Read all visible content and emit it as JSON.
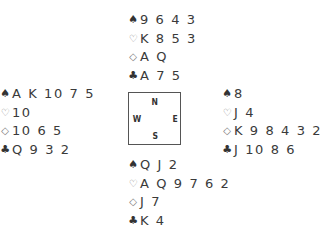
{
  "diagram": {
    "type": "bridge-deal",
    "suit_symbols": {
      "spades": "♠",
      "hearts": "♡",
      "diamonds": "◇",
      "clubs": "♣"
    },
    "compass": {
      "north": "N",
      "south": "S",
      "east": "E",
      "west": "W"
    },
    "hands": {
      "north": {
        "spades": "9 6 4 3",
        "hearts": "K 8 5 3",
        "diamonds": "A Q",
        "clubs": "A 7 5"
      },
      "west": {
        "spades": "A K 10 7 5",
        "hearts": "10",
        "diamonds": "10 6 5",
        "clubs": "Q 9 3 2"
      },
      "east": {
        "spades": "8",
        "hearts": "J 4",
        "diamonds": "K 9 8 4 3 2",
        "clubs": "J 10 8 6"
      },
      "south": {
        "spades": "Q J 2",
        "hearts": "A Q 9 7 6 2",
        "diamonds": "J 7",
        "clubs": "K 4"
      }
    }
  }
}
